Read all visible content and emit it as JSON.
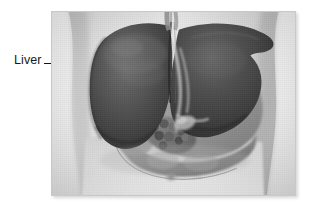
{
  "figure": {
    "alt_description": "Grayscale anatomical illustration of the human upper abdomen showing the liver overlying the stomach and intestines, viewed from the front",
    "subject": "Liver",
    "view": "anterior abdominal view",
    "style": "grayscale medical illustration"
  },
  "annotations": [
    {
      "id": "liver-label",
      "label": "Liver",
      "leader_line": true,
      "points_to": "left lobe of liver"
    }
  ],
  "frame": {
    "border_color": "#c9c9c9",
    "shadow": true,
    "background": "#ffffff"
  },
  "palette": {
    "page_background": "#ffffff",
    "label_text": "#1a1a1a",
    "leader_line": "#141414",
    "liver_dark": "#3c3c3c",
    "liver_mid": "#565656",
    "liver_highlight": "#7e7e7e",
    "stomach_gray": "#9a9a9a",
    "intestine_gray": "#8a8a8a",
    "skin_light": "#d8d8d8",
    "skin_shadow": "#b6b6b6",
    "backdrop": "#e9e9e9"
  },
  "anatomy_parts": [
    {
      "name": "liver-left-lobe",
      "tone": "dark"
    },
    {
      "name": "liver-right-lobe",
      "tone": "dark"
    },
    {
      "name": "falciform-ligament",
      "tone": "mid"
    },
    {
      "name": "esophagus",
      "tone": "mid"
    },
    {
      "name": "bile-duct",
      "tone": "light"
    },
    {
      "name": "gallbladder",
      "tone": "mid"
    },
    {
      "name": "stomach",
      "tone": "mid-light"
    },
    {
      "name": "pancreas",
      "tone": "mid"
    },
    {
      "name": "small-intestine",
      "tone": "mid"
    },
    {
      "name": "duodenum",
      "tone": "mid"
    },
    {
      "name": "abdominal-wall",
      "tone": "light"
    },
    {
      "name": "navel",
      "tone": "shadow"
    }
  ]
}
